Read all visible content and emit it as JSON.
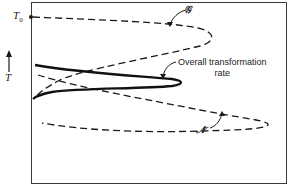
{
  "figure": {
    "y_axis_label": "T",
    "start_temperature_label": "T",
    "start_temperature_subscript": "0",
    "curves": [
      {
        "id": "G",
        "label": "𝒢",
        "description": "growth rate",
        "style": "dashed"
      },
      {
        "id": "N",
        "label": "𝒩̇",
        "description": "nucleation rate",
        "style": "dashed"
      },
      {
        "id": "overall",
        "label_line1": "Overall  transformation",
        "label_line2": "rate",
        "style": "solid"
      }
    ],
    "colors": {
      "line": "#1a1a1a",
      "frame": "#3a3a3a",
      "background": "#ffffff"
    }
  }
}
